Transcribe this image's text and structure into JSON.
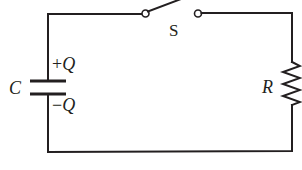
{
  "diagram": {
    "type": "RC circuit",
    "colors": {
      "line": "#231f20",
      "background": "#ffffff"
    },
    "labels": {
      "switch": "S",
      "capacitor": "C",
      "plus_charge_sign": "+",
      "plus_charge_symbol": "Q",
      "minus_charge_sign": "−",
      "minus_charge_symbol": "Q",
      "resistor": "R"
    },
    "components": [
      {
        "id": "switch",
        "label": "S",
        "state": "open"
      },
      {
        "id": "capacitor",
        "label": "C",
        "charge_top": "+Q",
        "charge_bottom": "−Q"
      },
      {
        "id": "resistor",
        "label": "R"
      }
    ]
  }
}
